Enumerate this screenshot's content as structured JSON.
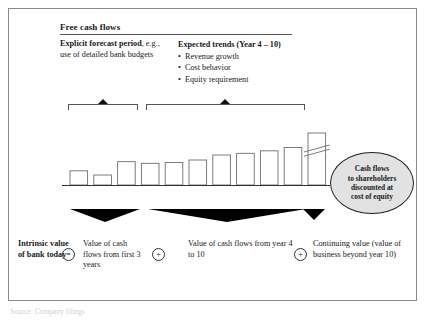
{
  "figure": {
    "header": {
      "title": "Free cash flows"
    },
    "explicit": {
      "bold_part": "Explicit forecast period",
      "rest": ", e.g., use of detailed bank budgets"
    },
    "trends": {
      "heading": "Expected trends (Year 4 – 10)",
      "bullet_glyph": "•",
      "items": [
        "Revenue growth",
        "Cost behavior",
        "Equity requirement"
      ]
    },
    "callout": {
      "lines": [
        "Cash flows",
        "to shareholders",
        "discounted at",
        "cost of equity"
      ]
    },
    "bottom": {
      "intrinsic": "Intrinsic value of bank today",
      "operator_equals": "=",
      "term_1": "Value of cash flows from first 3 years",
      "operator_plus_1": "+",
      "term_2": "Value of cash flows from year 4 to 10",
      "operator_plus_2": "+",
      "term_3": "Continuing value (value of business beyond year 10)"
    },
    "source_caption": "Source: Company filings",
    "colors": {
      "frame_border": "#8a8a8a",
      "rule": "#555555",
      "bar_stroke": "#6e6e6e",
      "baseline": "#333333",
      "marker_fill": "#111111",
      "triangle_fill": "#000000",
      "callout_fill": "#e2e2e2",
      "callout_border": "#222222",
      "text": "#1a1a1a"
    }
  },
  "chart_data": {
    "type": "bar",
    "title": "Free cash flows",
    "xlabel": "",
    "ylabel": "",
    "grid": false,
    "legend": null,
    "categories": [
      "Year 1",
      "Year 2",
      "Year 3",
      "Year 4",
      "Year 5",
      "Year 6",
      "Year 7",
      "Year 8",
      "Year 9",
      "Year 10",
      "Continuing value"
    ],
    "values": [
      17,
      12,
      28,
      26,
      27,
      30,
      36,
      38,
      41,
      45,
      95
    ],
    "ylim": [
      0,
      100
    ],
    "annotations": [
      {
        "text": "axis-break on final bar",
        "category": "Continuing value",
        "note": "Final bar drawn truncated with a double-diagonal break mark indicating the value extends beyond the plot area."
      },
      {
        "text": "Explicit forecast period",
        "covers": [
          "Year 1",
          "Year 2",
          "Year 3"
        ]
      },
      {
        "text": "Expected trends (Year 4 – 10)",
        "covers": [
          "Year 4",
          "Year 5",
          "Year 6",
          "Year 7",
          "Year 8",
          "Year 9",
          "Year 10"
        ]
      }
    ]
  }
}
